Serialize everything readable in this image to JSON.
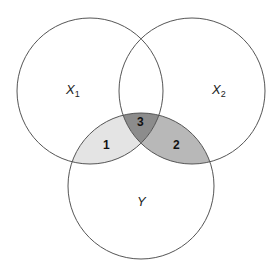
{
  "diagram": {
    "type": "venn",
    "sets": [
      {
        "id": "X1",
        "label": "X",
        "subscript": "1",
        "cx": 90,
        "cy": 91,
        "r": 73
      },
      {
        "id": "X2",
        "label": "X",
        "subscript": "2",
        "cx": 192,
        "cy": 91,
        "r": 73
      },
      {
        "id": "Y",
        "label": "Y",
        "subscript": "",
        "cx": 141,
        "cy": 186,
        "r": 73
      }
    ],
    "regions": [
      {
        "id": "1",
        "label": "1",
        "description": "X1 ∩ Y (not X2)",
        "fill": "#e4e4e4"
      },
      {
        "id": "2",
        "label": "2",
        "description": "X2 ∩ Y (not X1)",
        "fill": "#b8b8b8"
      },
      {
        "id": "3",
        "label": "3",
        "description": "X1 ∩ X2 ∩ Y",
        "fill": "#8c8c8c"
      }
    ],
    "stroke_color": "#555555"
  }
}
